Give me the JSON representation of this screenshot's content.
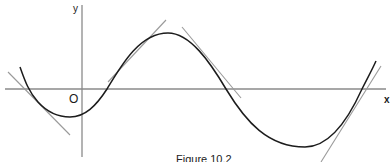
{
  "figure": {
    "caption": "Figure 10.2",
    "axes": {
      "x_label": "x",
      "y_label": "y",
      "origin_label": "O"
    }
  },
  "colors": {
    "curve": "#1c1c1c",
    "tangent": "#9a9a9a",
    "axis": "#8a8a8a",
    "background": "#ffffff"
  },
  "geometry": {
    "x_axis": {
      "x1": 5,
      "y1": 89,
      "x2": 386,
      "y2": 89
    },
    "y_axis": {
      "x1": 82,
      "y1": 5,
      "x2": 82,
      "y2": 157
    },
    "curve_path": "M 20 67 C 24 78, 28 91, 38 102 C 48 113, 60 117, 70 117 C 85 117, 96 106, 107 89 C 122 64, 140 33, 168 33 C 190 33, 210 62, 226 89 C 246 122, 268 147, 305 147 C 330 147, 348 120, 362 89 C 368 77, 372 70, 376 61",
    "tangents": [
      {
        "name": "tangent-left-crossing",
        "x1": 8,
        "y1": 72,
        "x2": 70,
        "y2": 135
      },
      {
        "name": "tangent-rising-slope",
        "x1": 108,
        "y1": 82,
        "x2": 166,
        "y2": 20
      },
      {
        "name": "tangent-falling-slope",
        "x1": 182,
        "y1": 27,
        "x2": 241,
        "y2": 98
      },
      {
        "name": "tangent-right-crossing",
        "x1": 321,
        "y1": 162,
        "x2": 381,
        "y2": 66
      }
    ]
  }
}
